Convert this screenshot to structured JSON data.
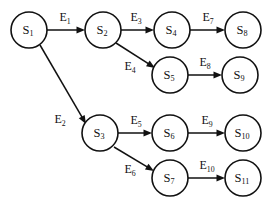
{
  "diagram": {
    "background_color": "#ffffff",
    "stroke_color": "#111111",
    "node_radius": 18,
    "nodes": [
      {
        "id": "S1",
        "base": "S",
        "sub": "1",
        "cx": 29,
        "cy": 30
      },
      {
        "id": "S2",
        "base": "S",
        "sub": "2",
        "cx": 103,
        "cy": 30
      },
      {
        "id": "S4",
        "base": "S",
        "sub": "4",
        "cx": 172,
        "cy": 30
      },
      {
        "id": "S8",
        "base": "S",
        "sub": "8",
        "cx": 243,
        "cy": 30
      },
      {
        "id": "S5",
        "base": "S",
        "sub": "5",
        "cx": 170,
        "cy": 75
      },
      {
        "id": "S9",
        "base": "S",
        "sub": "9",
        "cx": 240,
        "cy": 75
      },
      {
        "id": "S3",
        "base": "S",
        "sub": "3",
        "cx": 100,
        "cy": 133
      },
      {
        "id": "S6",
        "base": "S",
        "sub": "6",
        "cx": 170,
        "cy": 133
      },
      {
        "id": "S10",
        "base": "S",
        "sub": "10",
        "cx": 243,
        "cy": 133
      },
      {
        "id": "S7",
        "base": "S",
        "sub": "7",
        "cx": 170,
        "cy": 178
      },
      {
        "id": "S11",
        "base": "S",
        "sub": "11",
        "cx": 243,
        "cy": 178
      }
    ],
    "edges": [
      {
        "id": "E1",
        "base": "E",
        "sub": "1",
        "from": "S1",
        "to": "S2",
        "x1": 47,
        "y1": 30,
        "x2": 85,
        "y2": 30,
        "lx": 65,
        "ly": 21
      },
      {
        "id": "E2",
        "base": "E",
        "sub": "2",
        "from": "S1",
        "to": "S3",
        "x1": 40,
        "y1": 45,
        "x2": 86,
        "y2": 124,
        "lx": 60,
        "ly": 123
      },
      {
        "id": "E3",
        "base": "E",
        "sub": "3",
        "from": "S2",
        "to": "S4",
        "x1": 121,
        "y1": 30,
        "x2": 154,
        "y2": 30,
        "lx": 136,
        "ly": 21
      },
      {
        "id": "E4",
        "base": "E",
        "sub": "4",
        "from": "S2",
        "to": "S5",
        "x1": 116,
        "y1": 43,
        "x2": 155,
        "y2": 68,
        "lx": 130,
        "ly": 70
      },
      {
        "id": "E5",
        "base": "E",
        "sub": "5",
        "from": "S3",
        "to": "S6",
        "x1": 118,
        "y1": 133,
        "x2": 152,
        "y2": 133,
        "lx": 136,
        "ly": 124
      },
      {
        "id": "E6",
        "base": "E",
        "sub": "6",
        "from": "S3",
        "to": "S7",
        "x1": 114,
        "y1": 147,
        "x2": 154,
        "y2": 171,
        "lx": 130,
        "ly": 173
      },
      {
        "id": "E7",
        "base": "E",
        "sub": "7",
        "from": "S4",
        "to": "S8",
        "x1": 190,
        "y1": 30,
        "x2": 225,
        "y2": 30,
        "lx": 208,
        "ly": 21
      },
      {
        "id": "E8",
        "base": "E",
        "sub": "8",
        "from": "S5",
        "to": "S9",
        "x1": 188,
        "y1": 75,
        "x2": 222,
        "y2": 75,
        "lx": 205,
        "ly": 66
      },
      {
        "id": "E9",
        "base": "E",
        "sub": "9",
        "from": "S6",
        "to": "S10",
        "x1": 188,
        "y1": 133,
        "x2": 225,
        "y2": 133,
        "lx": 207,
        "ly": 124
      },
      {
        "id": "E10",
        "base": "E",
        "sub": "10",
        "from": "S7",
        "to": "S11",
        "x1": 188,
        "y1": 178,
        "x2": 225,
        "y2": 178,
        "lx": 207,
        "ly": 169
      }
    ]
  }
}
